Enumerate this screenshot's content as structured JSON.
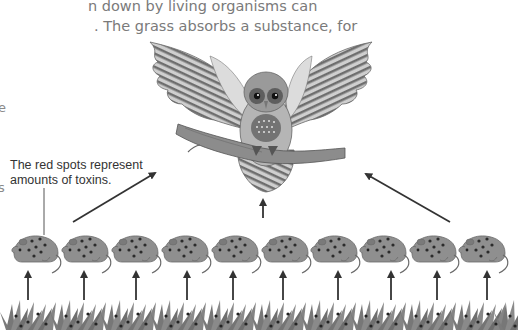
{
  "intro_text": {
    "line1": "n down by living organisms can",
    "line2": ". The grass absorbs a substance, for"
  },
  "edge_fragments": {
    "frag1": "e",
    "frag2": "s"
  },
  "annotation": {
    "line1": "The red spots represent",
    "line2": "amounts of toxins."
  },
  "diagram": {
    "predator": "owl-on-branch",
    "prey_count": 10,
    "prey": "mouse-with-toxin-spots",
    "producer": "grass-with-toxin-spots",
    "arrows": "energy-flow-upward",
    "colors": {
      "mouse_body": "#8f8f8f",
      "mouse_outline": "#6a6a6a",
      "toxin_spot": "#2b2b2b",
      "arrow": "#333333",
      "grass": "#7d7d7d",
      "text": "#333333",
      "intro_text": "#7a7a7a"
    }
  }
}
